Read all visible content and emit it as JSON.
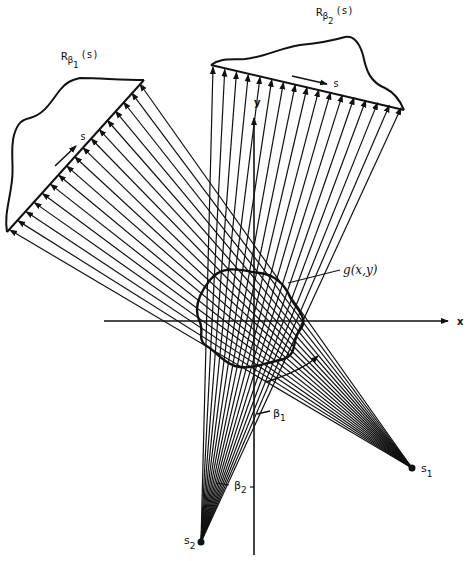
{
  "diagram": {
    "type": "fan-beam projection geometry",
    "labels": {
      "projection1": "R",
      "projection1_sub": "β",
      "projection1_subsub": "1",
      "projection1_arg": "(s)",
      "projection2": "R",
      "projection2_sub": "β",
      "projection2_subsub": "2",
      "projection2_arg": "(s)",
      "s_axis1": "s",
      "s_axis2": "s",
      "object": "g(x,y)",
      "x_axis": "x",
      "y_axis": "y",
      "beta1": "β",
      "beta1_sub": "1",
      "beta2": "β",
      "beta2_sub": "2",
      "source1": "s",
      "source1_sub": "1",
      "source2": "s",
      "source2_sub": "2"
    },
    "sources": [
      {
        "name": "S1",
        "x": 412,
        "y": 468
      },
      {
        "name": "S2",
        "x": 201,
        "y": 542
      }
    ],
    "origin": {
      "x": 255,
      "y": 320
    },
    "ray_count_per_fan": 17,
    "colors": {
      "ink": "#111111",
      "background": "#ffffff"
    }
  }
}
